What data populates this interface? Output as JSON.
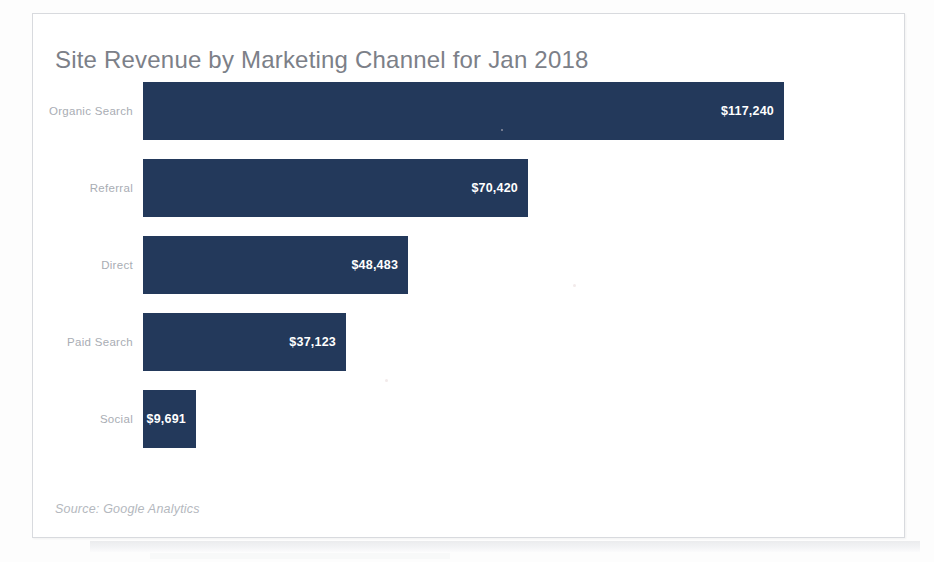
{
  "card": {
    "title": "Site Revenue by Marketing Channel for Jan 2018",
    "source_note": "Source: Google Analytics"
  },
  "colors": {
    "bar": "#23395b",
    "title_text": "#7c8088",
    "category_text": "#a9adb4",
    "value_text": "#ffffff",
    "source_text": "#b4b8be",
    "card_border": "#d8dade",
    "card_background": "#ffffff"
  },
  "chart_data": {
    "type": "bar",
    "orientation": "horizontal",
    "title": "Site Revenue by Marketing Channel for Jan 2018",
    "subtitle": "",
    "xlabel": "",
    "ylabel": "",
    "categories": [
      "Organic Search",
      "Referral",
      "Direct",
      "Paid Search",
      "Social"
    ],
    "values": [
      117240,
      70420,
      48483,
      37123,
      9691
    ],
    "value_labels": [
      "$117,240",
      "$70,420",
      "$48,483",
      "$37,123",
      "$9,691"
    ],
    "value_label_position": "inside-end",
    "xlim": [
      0,
      117240
    ],
    "grid": false,
    "legend": false,
    "axis_visible": false,
    "tick_labels_x": [],
    "annotations": [
      "Source: Google Analytics"
    ],
    "series": [
      {
        "name": "Site Revenue",
        "values": [
          117240,
          70420,
          48483,
          37123,
          9691
        ],
        "color": "#23395b"
      }
    ]
  }
}
